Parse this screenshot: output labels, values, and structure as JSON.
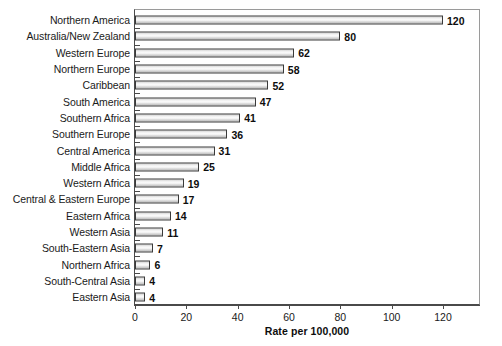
{
  "chart_data": {
    "type": "bar",
    "orientation": "horizontal",
    "title": "",
    "xlabel": "Rate per 100,000",
    "ylabel": "",
    "xlim": [
      0,
      134.8
    ],
    "xticks": [
      0,
      20,
      40,
      60,
      80,
      100,
      120
    ],
    "grid": false,
    "legend": null,
    "categories": [
      "Northern America",
      "Australia/New Zealand",
      "Western Europe",
      "Northern Europe",
      "Caribbean",
      "South America",
      "Southern Africa",
      "Southern Europe",
      "Central America",
      "Middle Africa",
      "Western Africa",
      "Central & Eastern Europe",
      "Eastern Africa",
      "Western Asia",
      "South-Eastern Asia",
      "Northern Africa",
      "South-Central Asia",
      "Eastern Asia"
    ],
    "values": [
      120,
      80,
      62,
      58,
      52,
      47,
      41,
      36,
      31,
      25,
      19,
      17,
      14,
      11,
      7,
      6,
      4,
      4
    ],
    "value_labels": [
      "120",
      "80",
      "62",
      "58",
      "52",
      "47",
      "41",
      "36",
      "31",
      "25",
      "19",
      "17",
      "14",
      "11",
      "7",
      "6",
      "4",
      "4"
    ],
    "bar_fill_color": "#e8e8e8",
    "bar_border_color": "#3a3a3a",
    "axis_color": "#4a4a4a",
    "background_color": "#ffffff"
  }
}
